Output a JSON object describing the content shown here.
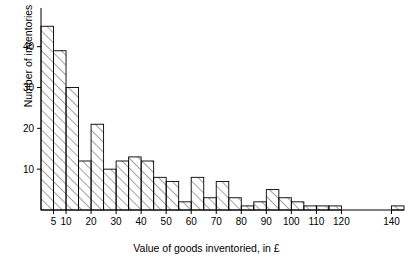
{
  "chart_data": {
    "type": "bar",
    "title": "",
    "subtitle": "",
    "xlabel": "Value of goods inventoried, in £",
    "ylabel": "Number of inventories",
    "xlim": [
      0,
      145
    ],
    "ylim": [
      0,
      48
    ],
    "grid": false,
    "legend": null,
    "bin_width": 5,
    "xticks": [
      5,
      10,
      20,
      30,
      40,
      50,
      60,
      70,
      80,
      90,
      100,
      110,
      120,
      140
    ],
    "xtick_labels": [
      "5",
      "10",
      "20",
      "30",
      "40",
      "50",
      "60",
      "70",
      "80",
      "90",
      "100",
      "110",
      "120",
      "140"
    ],
    "yticks": [
      10,
      20,
      30,
      40
    ],
    "ytick_labels": [
      "10",
      "20",
      "30",
      "40"
    ],
    "bin_edges": [
      0,
      5,
      10,
      15,
      20,
      25,
      30,
      35,
      40,
      45,
      50,
      55,
      60,
      65,
      70,
      75,
      80,
      85,
      90,
      95,
      100,
      105,
      110,
      115,
      120,
      125,
      130,
      135,
      140,
      145
    ],
    "categories": [
      "0-5",
      "5-10",
      "10-15",
      "15-20",
      "20-25",
      "25-30",
      "30-35",
      "35-40",
      "40-45",
      "45-50",
      "50-55",
      "55-60",
      "60-65",
      "65-70",
      "70-75",
      "75-80",
      "80-85",
      "85-90",
      "90-95",
      "95-100",
      "100-105",
      "105-110",
      "110-115",
      "115-120",
      "120-125",
      "125-130",
      "130-135",
      "135-140",
      "140-145"
    ],
    "values": [
      45,
      39,
      30,
      12,
      21,
      10,
      12,
      13,
      12,
      8,
      7,
      2,
      8,
      3,
      7,
      3,
      1,
      2,
      5,
      3,
      2,
      1,
      1,
      1,
      0,
      0,
      0,
      0,
      1
    ],
    "bar_style": {
      "fill": "hatch-diagonal",
      "edge_color": "#000000",
      "hatch_color": "#555555"
    }
  },
  "axis": {
    "axis_color": "#000000",
    "tick_length": 4
  }
}
